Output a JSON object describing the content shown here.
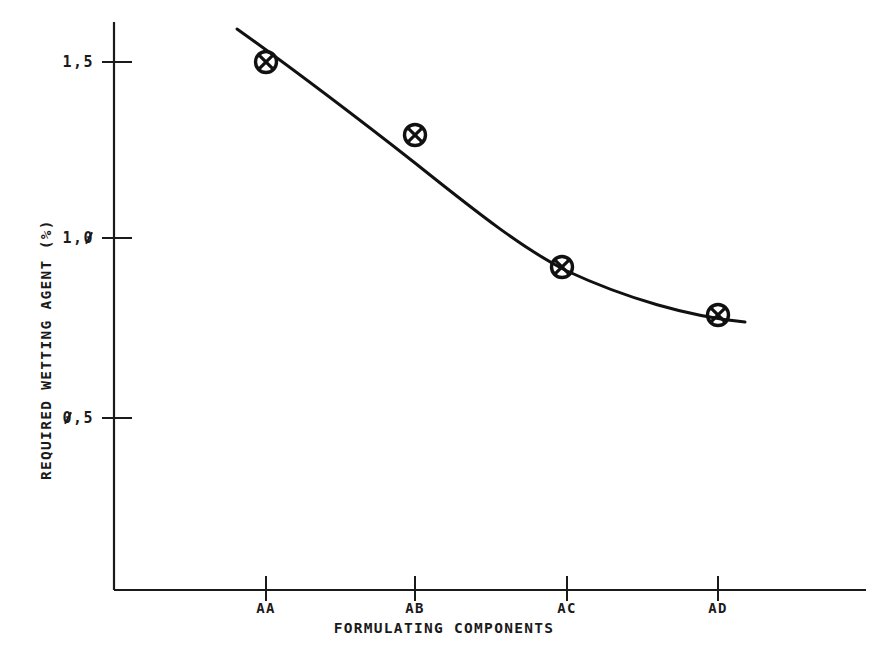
{
  "chart_data": {
    "type": "line",
    "title": "",
    "subtitle": "",
    "xlabel": "FORMULATING COMPONENTS",
    "ylabel": "REQUIRED WETTING AGENT (%)",
    "categories": [
      "AA",
      "AB",
      "AC",
      "AD"
    ],
    "values": [
      1.5,
      1.29,
      0.92,
      0.78
    ],
    "series": [
      {
        "name": "Required wetting agent",
        "values": [
          1.5,
          1.29,
          0.92,
          0.78
        ],
        "marker": "circle-x",
        "has_fitted_curve": true
      }
    ],
    "ytick_labels": [
      "1,5",
      "1,0",
      "0,5"
    ],
    "ytick_values": [
      1.5,
      1.0,
      0.5
    ],
    "ylim": [
      0.0,
      1.62
    ],
    "xlim_categories": [
      "AA",
      "AB",
      "AC",
      "AD"
    ],
    "grid": false,
    "legend": false,
    "legend_position": "none",
    "decimal_separator": ",",
    "axis_color": "#1a1a1a",
    "marker_color": "#111111",
    "curve_color": "#111111",
    "background_color": "#ffffff"
  },
  "axis": {
    "y_title": "REQUIRED WETTING AGENT (%)",
    "x_title": "FORMULATING COMPONENTS",
    "y_ticks": [
      {
        "label": "1,5",
        "value": 1.5
      },
      {
        "label": "1,0",
        "value": 1.0
      },
      {
        "label": "0,5",
        "value": 0.5
      }
    ],
    "x_ticks": [
      {
        "label": "AA"
      },
      {
        "label": "AB"
      },
      {
        "label": "AC"
      },
      {
        "label": "AD"
      }
    ]
  }
}
